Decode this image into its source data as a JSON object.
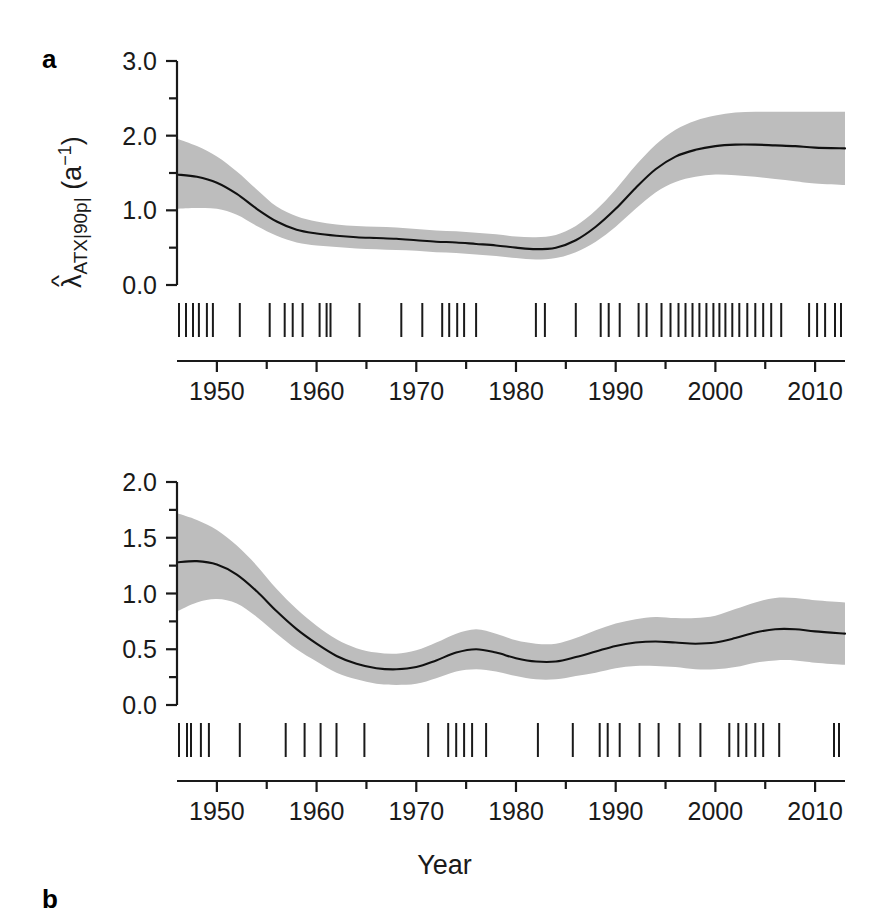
{
  "figure": {
    "type": "multi-panel-line-chart-with-rug",
    "background": "#ffffff",
    "band_color": "#bdbdbd",
    "line_color": "#111111",
    "xlabel": "Year"
  },
  "panels": {
    "a": {
      "letter": "a",
      "ylabel_lambda": "λ",
      "ylabel_hat": "^",
      "ylabel_sub": "ATX|90p|",
      "ylabel_unit_open": " (a",
      "ylabel_unit_sup": "−1",
      "ylabel_unit_close": ")",
      "ytick_labels": [
        "0.0",
        "1.0",
        "2.0",
        "3.0"
      ],
      "ytick_values": [
        0.0,
        1.0,
        2.0,
        3.0
      ],
      "yminor_values": [
        0.5,
        1.5,
        2.5
      ],
      "xtick_labels": [
        "1950",
        "1960",
        "1970",
        "1980",
        "1990",
        "2000",
        "2010"
      ],
      "xtick_values": [
        1950,
        1960,
        1970,
        1980,
        1990,
        2000,
        2010
      ],
      "xminor_values": [
        1955,
        1965,
        1975,
        1985,
        1995,
        2005
      ]
    },
    "b": {
      "letter": "b",
      "ylabel_lambda": "λ",
      "ylabel_hat": "^",
      "ylabel_sub": "ATX|95p|",
      "ylabel_unit_open": " (a",
      "ylabel_unit_sup": "−1",
      "ylabel_unit_close": ")",
      "ytick_labels": [
        "0.0",
        "0.5",
        "1.0",
        "1.5",
        "2.0"
      ],
      "ytick_values": [
        0.0,
        0.5,
        1.0,
        1.5,
        2.0
      ],
      "yminor_values": [
        0.25,
        0.75,
        1.25,
        1.75
      ],
      "xtick_labels": [
        "1950",
        "1960",
        "1970",
        "1980",
        "1990",
        "2000",
        "2010"
      ],
      "xtick_values": [
        1950,
        1960,
        1970,
        1980,
        1990,
        2000,
        2010
      ],
      "xminor_values": [
        1955,
        1965,
        1975,
        1985,
        1995,
        2005
      ]
    }
  },
  "chart_data": [
    {
      "type": "line",
      "panel": "a",
      "title": "",
      "xlabel": "Year",
      "ylabel": "λ̂_ATX|90p| (a−1)",
      "xlim": [
        1946,
        2013
      ],
      "ylim": [
        0.0,
        3.0
      ],
      "grid": false,
      "legend": "none",
      "series": [
        {
          "name": "fitted intensity",
          "x": [
            1946,
            1948,
            1950,
            1952,
            1954,
            1956,
            1958,
            1960,
            1962,
            1964,
            1966,
            1968,
            1970,
            1972,
            1974,
            1976,
            1978,
            1980,
            1982,
            1984,
            1986,
            1988,
            1990,
            1992,
            1994,
            1996,
            1998,
            2000,
            2002,
            2004,
            2006,
            2008,
            2010,
            2013
          ],
          "values": [
            1.48,
            1.45,
            1.37,
            1.22,
            1.02,
            0.85,
            0.74,
            0.69,
            0.66,
            0.64,
            0.63,
            0.62,
            0.6,
            0.58,
            0.57,
            0.55,
            0.53,
            0.5,
            0.48,
            0.5,
            0.6,
            0.78,
            1.02,
            1.3,
            1.55,
            1.72,
            1.81,
            1.86,
            1.88,
            1.88,
            1.87,
            1.86,
            1.84,
            1.83
          ]
        },
        {
          "name": "upper CI",
          "x": [
            1946,
            1948,
            1950,
            1952,
            1954,
            1956,
            1958,
            1960,
            1962,
            1964,
            1966,
            1968,
            1970,
            1972,
            1974,
            1976,
            1978,
            1980,
            1982,
            1984,
            1986,
            1988,
            1990,
            1992,
            1994,
            1996,
            1998,
            2000,
            2002,
            2004,
            2006,
            2008,
            2010,
            2013
          ],
          "values": [
            1.96,
            1.86,
            1.72,
            1.52,
            1.28,
            1.05,
            0.92,
            0.85,
            0.81,
            0.79,
            0.78,
            0.77,
            0.75,
            0.73,
            0.72,
            0.7,
            0.68,
            0.65,
            0.64,
            0.67,
            0.79,
            1.0,
            1.28,
            1.6,
            1.88,
            2.08,
            2.2,
            2.27,
            2.31,
            2.32,
            2.32,
            2.32,
            2.32,
            2.32
          ]
        },
        {
          "name": "lower CI",
          "x": [
            1946,
            1948,
            1950,
            1952,
            1954,
            1956,
            1958,
            1960,
            1962,
            1964,
            1966,
            1968,
            1970,
            1972,
            1974,
            1976,
            1978,
            1980,
            1982,
            1984,
            1986,
            1988,
            1990,
            1992,
            1994,
            1996,
            1998,
            2000,
            2002,
            2004,
            2006,
            2008,
            2010,
            2013
          ],
          "values": [
            1.02,
            1.03,
            1.02,
            0.94,
            0.79,
            0.66,
            0.57,
            0.53,
            0.51,
            0.49,
            0.48,
            0.47,
            0.46,
            0.44,
            0.43,
            0.41,
            0.39,
            0.36,
            0.34,
            0.36,
            0.44,
            0.58,
            0.78,
            1.02,
            1.24,
            1.38,
            1.45,
            1.48,
            1.47,
            1.45,
            1.42,
            1.39,
            1.36,
            1.34
          ]
        }
      ],
      "rug_values": [
        1946.2,
        1946.9,
        1947.6,
        1948.2,
        1949.0,
        1949.6,
        1952.3,
        1955.3,
        1956.8,
        1957.6,
        1958.6,
        1960.3,
        1961.0,
        1961.4,
        1964.3,
        1968.5,
        1970.6,
        1972.6,
        1973.3,
        1974.1,
        1974.8,
        1976.0,
        1982.0,
        1982.9,
        1986.0,
        1988.5,
        1989.3,
        1990.4,
        1992.3,
        1993.1,
        1994.6,
        1995.5,
        1996.3,
        1997.0,
        1997.7,
        1998.4,
        1999.1,
        1999.8,
        2000.4,
        2001.0,
        2001.7,
        2002.4,
        2003.2,
        2004.0,
        2004.8,
        2005.6,
        2006.6,
        2009.4,
        2010.2,
        2011.0,
        2012.0,
        2012.6
      ]
    },
    {
      "type": "line",
      "panel": "b",
      "title": "",
      "xlabel": "Year",
      "ylabel": "λ̂_ATX|95p| (a−1)",
      "xlim": [
        1946,
        2013
      ],
      "ylim": [
        0.0,
        2.0
      ],
      "grid": false,
      "legend": "none",
      "series": [
        {
          "name": "fitted intensity",
          "x": [
            1946,
            1948,
            1950,
            1952,
            1954,
            1956,
            1958,
            1960,
            1962,
            1964,
            1966,
            1968,
            1970,
            1972,
            1974,
            1976,
            1978,
            1980,
            1982,
            1984,
            1986,
            1988,
            1990,
            1992,
            1994,
            1996,
            1998,
            2000,
            2002,
            2004,
            2006,
            2008,
            2010,
            2013
          ],
          "values": [
            1.28,
            1.29,
            1.26,
            1.17,
            1.02,
            0.84,
            0.68,
            0.55,
            0.44,
            0.37,
            0.33,
            0.32,
            0.34,
            0.4,
            0.47,
            0.5,
            0.47,
            0.42,
            0.39,
            0.39,
            0.43,
            0.48,
            0.53,
            0.56,
            0.57,
            0.56,
            0.55,
            0.56,
            0.6,
            0.65,
            0.68,
            0.68,
            0.66,
            0.64
          ]
        },
        {
          "name": "upper CI",
          "x": [
            1946,
            1948,
            1950,
            1952,
            1954,
            1956,
            1958,
            1960,
            1962,
            1964,
            1966,
            1968,
            1970,
            1972,
            1974,
            1976,
            1978,
            1980,
            1982,
            1984,
            1986,
            1988,
            1990,
            1992,
            1994,
            1996,
            1998,
            2000,
            2002,
            2004,
            2006,
            2008,
            2010,
            2013
          ],
          "values": [
            1.72,
            1.66,
            1.57,
            1.43,
            1.25,
            1.04,
            0.86,
            0.71,
            0.59,
            0.51,
            0.47,
            0.46,
            0.49,
            0.56,
            0.64,
            0.68,
            0.64,
            0.58,
            0.55,
            0.55,
            0.6,
            0.67,
            0.73,
            0.77,
            0.79,
            0.78,
            0.78,
            0.8,
            0.86,
            0.92,
            0.96,
            0.96,
            0.94,
            0.92
          ]
        },
        {
          "name": "lower CI",
          "x": [
            1946,
            1948,
            1950,
            1952,
            1954,
            1956,
            1958,
            1960,
            1962,
            1964,
            1966,
            1968,
            1970,
            1972,
            1974,
            1976,
            1978,
            1980,
            1982,
            1984,
            1986,
            1988,
            1990,
            1992,
            1994,
            1996,
            1998,
            2000,
            2002,
            2004,
            2006,
            2008,
            2010,
            2013
          ],
          "values": [
            0.84,
            0.92,
            0.95,
            0.91,
            0.79,
            0.64,
            0.5,
            0.39,
            0.29,
            0.23,
            0.19,
            0.18,
            0.19,
            0.24,
            0.3,
            0.32,
            0.3,
            0.26,
            0.23,
            0.23,
            0.26,
            0.29,
            0.33,
            0.35,
            0.35,
            0.34,
            0.32,
            0.32,
            0.34,
            0.38,
            0.4,
            0.4,
            0.38,
            0.36
          ]
        }
      ],
      "rug_values": [
        1946.2,
        1947.0,
        1947.4,
        1948.4,
        1949.2,
        1952.3,
        1956.9,
        1958.8,
        1960.4,
        1962.0,
        1964.8,
        1971.2,
        1973.2,
        1974.0,
        1974.8,
        1975.6,
        1977.0,
        1982.2,
        1985.7,
        1988.4,
        1989.2,
        1990.4,
        1992.4,
        1994.3,
        1996.4,
        1998.5,
        2001.4,
        2002.3,
        2003.1,
        2004.0,
        2004.8,
        2006.4,
        2011.9,
        2012.4
      ]
    }
  ]
}
